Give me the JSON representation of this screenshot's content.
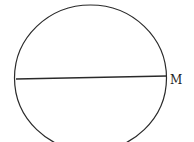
{
  "figure": {
    "shape": "ellipse",
    "chord_label": "M",
    "stroke_color": "#2a2a2a",
    "background": "#ffffff"
  }
}
